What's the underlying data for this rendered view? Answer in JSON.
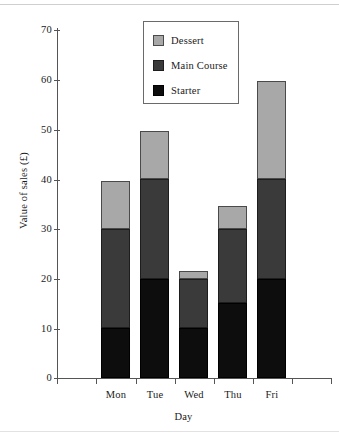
{
  "chart_data": {
    "type": "bar",
    "subtype": "stacked-bar",
    "title": "",
    "xlabel": "Day",
    "ylabel": "Value of sales (£)",
    "categories": [
      "Mon",
      "Tue",
      "Wed",
      "Thu",
      "Fri"
    ],
    "ylim": [
      0,
      70
    ],
    "yticks": [
      0,
      10,
      20,
      30,
      40,
      50,
      60,
      70
    ],
    "ytick_labels": [
      "0",
      "10",
      "20",
      "30",
      "40",
      "50",
      "60",
      "70"
    ],
    "grid": false,
    "legend_position": "top-center",
    "series": [
      {
        "name": "Starter",
        "color": "#0d0d0d",
        "values": [
          10,
          20,
          10,
          15,
          20
        ]
      },
      {
        "name": "Main Course",
        "color": "#3a3a3a",
        "values": [
          20,
          20,
          10,
          15,
          20
        ]
      },
      {
        "name": "Dessert",
        "color": "#a8a8a8",
        "values": [
          9.7,
          9.7,
          1.6,
          4.6,
          19.7
        ]
      }
    ],
    "stack_order_bottom_to_top": [
      "Starter",
      "Main Course",
      "Dessert"
    ],
    "totals": [
      39.7,
      49.7,
      21.6,
      34.6,
      59.7
    ]
  },
  "legend": {
    "entries": [
      {
        "label": "Dessert",
        "color": "#a8a8a8"
      },
      {
        "label": "Main Course",
        "color": "#3a3a3a"
      },
      {
        "label": "Starter",
        "color": "#0d0d0d"
      }
    ]
  },
  "axes": {
    "y_title": "Value of sales (£)",
    "x_title": "Day",
    "y_labels": [
      "70",
      "60",
      "50",
      "40",
      "30",
      "20",
      "10",
      "0"
    ],
    "x_labels": [
      "Mon",
      "Tue",
      "Wed",
      "Thu",
      "Fri"
    ]
  }
}
